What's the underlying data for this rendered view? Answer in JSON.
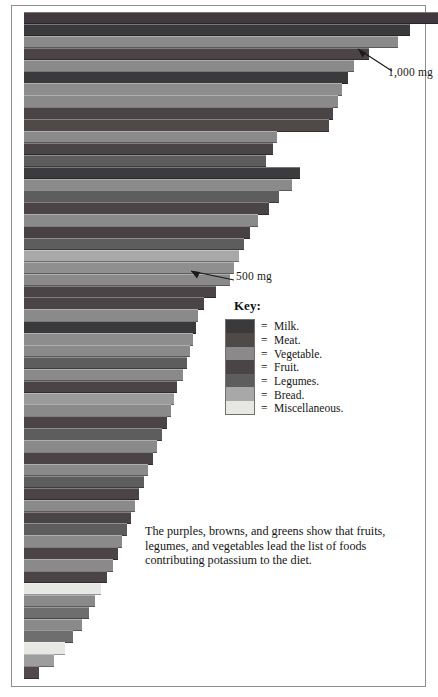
{
  "figure": {
    "key_title": "Key:",
    "caption": "The purples, browns, and greens show that fruits, legumes, and vegetables lead the list of foods contributing potassium to the diet.",
    "annotations": [
      {
        "name": "annotation-1000mg",
        "label": "1,000  mg",
        "value": 1000
      },
      {
        "name": "annotation-500mg",
        "label": "500  mg",
        "value": 500
      }
    ],
    "equals_glyph": "="
  },
  "chart_data": {
    "type": "bar",
    "orientation": "horizontal",
    "xlabel": "Potassium (mg)",
    "ylabel": "",
    "xlim": [
      0,
      1080
    ],
    "grid": false,
    "legend_position": "inside-right",
    "categories_legend": [
      "Milk.",
      "Meat.",
      "Vegetable.",
      "Fruit.",
      "Legumes.",
      "Bread.",
      "Miscellaneous."
    ],
    "legend_colors": [
      "#3a3a3c",
      "#4f4a48",
      "#8a8a8a",
      "#4a4447",
      "#5d5d5d",
      "#a8a8a8",
      "#e7e7e4"
    ],
    "reference_lines": [
      1000,
      500
    ],
    "bars": [
      {
        "group": "Fruit.",
        "value": 1080,
        "color": "#41393d"
      },
      {
        "group": "Milk.",
        "value": 1008,
        "color": "#3a3a3c"
      },
      {
        "group": "Vegetable.",
        "value": 975,
        "color": "#8a8a8a"
      },
      {
        "group": "Fruit.",
        "value": 900,
        "color": "#4a4447"
      },
      {
        "group": "Vegetable.",
        "value": 860,
        "color": "#8a8a8a"
      },
      {
        "group": "Milk.",
        "value": 845,
        "color": "#3a3a3c"
      },
      {
        "group": "Vegetable.",
        "value": 830,
        "color": "#8d8d8d"
      },
      {
        "group": "Vegetable.",
        "value": 818,
        "color": "#8a8a8a"
      },
      {
        "group": "Fruit.",
        "value": 805,
        "color": "#4a4447"
      },
      {
        "group": "Meat.",
        "value": 795,
        "color": "#4f4a48"
      },
      {
        "group": "Vegetable.",
        "value": 660,
        "color": "#8a8a8a"
      },
      {
        "group": "Fruit.",
        "value": 650,
        "color": "#4a4447"
      },
      {
        "group": "Legumes.",
        "value": 630,
        "color": "#5d5d5d"
      },
      {
        "group": "Milk.",
        "value": 720,
        "color": "#3c3c3e"
      },
      {
        "group": "Vegetable.",
        "value": 700,
        "color": "#8a8a8a"
      },
      {
        "group": "Legumes.",
        "value": 665,
        "color": "#5d5d5d"
      },
      {
        "group": "Fruit.",
        "value": 640,
        "color": "#4a4447"
      },
      {
        "group": "Vegetable.",
        "value": 610,
        "color": "#8a8a8a"
      },
      {
        "group": "Fruit.",
        "value": 590,
        "color": "#474144"
      },
      {
        "group": "Legumes.",
        "value": 575,
        "color": "#5d5d5d"
      },
      {
        "group": "Bread.",
        "value": 560,
        "color": "#a8a8a8"
      },
      {
        "group": "Vegetable.",
        "value": 548,
        "color": "#8f8f8f"
      },
      {
        "group": "Vegetable.",
        "value": 538,
        "color": "#8a8a8a"
      },
      {
        "group": "Fruit.",
        "value": 500,
        "color": "#4a4447"
      },
      {
        "group": "Fruit.",
        "value": 470,
        "color": "#4a4447"
      },
      {
        "group": "Vegetable.",
        "value": 455,
        "color": "#8a8a8a"
      },
      {
        "group": "Milk.",
        "value": 448,
        "color": "#3a3a3c"
      },
      {
        "group": "Vegetable.",
        "value": 440,
        "color": "#8d8d8d"
      },
      {
        "group": "Vegetable.",
        "value": 432,
        "color": "#8a8a8a"
      },
      {
        "group": "Legumes.",
        "value": 424,
        "color": "#5d5d5d"
      },
      {
        "group": "Vegetable.",
        "value": 415,
        "color": "#8a8a8a"
      },
      {
        "group": "Fruit.",
        "value": 400,
        "color": "#4a4447"
      },
      {
        "group": "Bread.",
        "value": 392,
        "color": "#9a9a9a"
      },
      {
        "group": "Vegetable.",
        "value": 384,
        "color": "#8a8a8a"
      },
      {
        "group": "Fruit.",
        "value": 372,
        "color": "#4a4447"
      },
      {
        "group": "Legumes.",
        "value": 360,
        "color": "#5d5d5d"
      },
      {
        "group": "Vegetable.",
        "value": 348,
        "color": "#8a8a8a"
      },
      {
        "group": "Fruit.",
        "value": 336,
        "color": "#4a4447"
      },
      {
        "group": "Vegetable.",
        "value": 324,
        "color": "#8a8a8a"
      },
      {
        "group": "Legumes.",
        "value": 312,
        "color": "#5d5d5d"
      },
      {
        "group": "Fruit.",
        "value": 300,
        "color": "#4a4447"
      },
      {
        "group": "Vegetable.",
        "value": 290,
        "color": "#8a8a8a"
      },
      {
        "group": "Fruit.",
        "value": 280,
        "color": "#4a4447"
      },
      {
        "group": "Legumes.",
        "value": 268,
        "color": "#5d5d5d"
      },
      {
        "group": "Vegetable.",
        "value": 256,
        "color": "#8a8a8a"
      },
      {
        "group": "Fruit.",
        "value": 244,
        "color": "#4a4447"
      },
      {
        "group": "Vegetable.",
        "value": 232,
        "color": "#8a8a8a"
      },
      {
        "group": "Fruit.",
        "value": 216,
        "color": "#4a4447"
      },
      {
        "group": "Miscellaneous.",
        "value": 200,
        "color": "#e7e7e4"
      },
      {
        "group": "Vegetable.",
        "value": 186,
        "color": "#8a8a8a"
      },
      {
        "group": "Legumes.",
        "value": 170,
        "color": "#6e6e6e"
      },
      {
        "group": "Vegetable.",
        "value": 150,
        "color": "#8a8a8a"
      },
      {
        "group": "Legumes.",
        "value": 128,
        "color": "#6e6e6e"
      },
      {
        "group": "Miscellaneous.",
        "value": 108,
        "color": "#e7e7e4"
      },
      {
        "group": "Bread.",
        "value": 78,
        "color": "#9e9e9e"
      },
      {
        "group": "Fruit.",
        "value": 40,
        "color": "#52494d"
      }
    ]
  }
}
